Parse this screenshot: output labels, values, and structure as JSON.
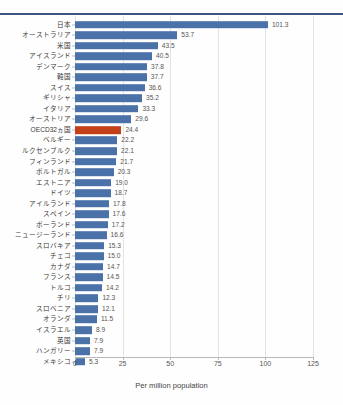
{
  "chart_data": {
    "type": "bar",
    "orientation": "horizontal",
    "title": "",
    "xlabel": "Per million population",
    "ylabel": "",
    "xlim": [
      0,
      125
    ],
    "xticks": [
      0,
      25,
      50,
      75,
      100,
      125
    ],
    "grid": true,
    "legend": null,
    "highlight_category": "OECD32ヵ国",
    "colors": {
      "bar": "#4a72a8",
      "highlight_bar": "#c4401a",
      "gridline": "#e3e3e3",
      "axis": "#b9b9b9",
      "top_rule": "#3e5480",
      "label_text": "#3a3a3a",
      "value_text": "#555555"
    },
    "categories": [
      "日本",
      "オーストラリア",
      "米国",
      "アイスランド",
      "デンマーク",
      "韓国",
      "スイス",
      "ギリシャ",
      "イタリア",
      "オーストリア",
      "OECD32ヵ国",
      "ベルギー",
      "ルクセンブルク",
      "フィンランド",
      "ポルトガル",
      "エストニア",
      "ドイツ",
      "アイルランド",
      "スペイン",
      "ポーランド",
      "ニュージーランド",
      "スロバキア",
      "チェコ",
      "カナダ",
      "フランス",
      "トルコ",
      "チリ",
      "スロベニア",
      "オランダ",
      "イスラエル",
      "英国",
      "ハンガリー",
      "メキシコ"
    ],
    "values": [
      101.3,
      53.7,
      43.5,
      40.5,
      37.8,
      37.7,
      36.6,
      35.2,
      33.3,
      29.6,
      24.4,
      22.2,
      22.1,
      21.7,
      20.3,
      19.0,
      18.7,
      17.8,
      17.6,
      17.2,
      16.6,
      15.3,
      15.0,
      14.7,
      14.5,
      14.2,
      12.3,
      12.1,
      11.5,
      8.9,
      7.9,
      7.9,
      5.3
    ],
    "value_labels": [
      "101.3",
      "53.7",
      "43.5",
      "40.5",
      "37.8",
      "37.7",
      "36.6",
      "35.2",
      "33.3",
      "29.6",
      "24.4",
      "22.2",
      "22.1",
      "21.7",
      "20.3",
      "19.0",
      "18.7",
      "17.8",
      "17.6",
      "17.2",
      "16.6",
      "15.3",
      "15.0",
      "14.7",
      "14.5",
      "14.2",
      "12.3",
      "12.1",
      "11.5",
      "8.9",
      "7.9",
      "7.9",
      "5.3"
    ],
    "xtick_labels": [
      "0",
      "25",
      "50",
      "75",
      "100",
      "125"
    ]
  }
}
